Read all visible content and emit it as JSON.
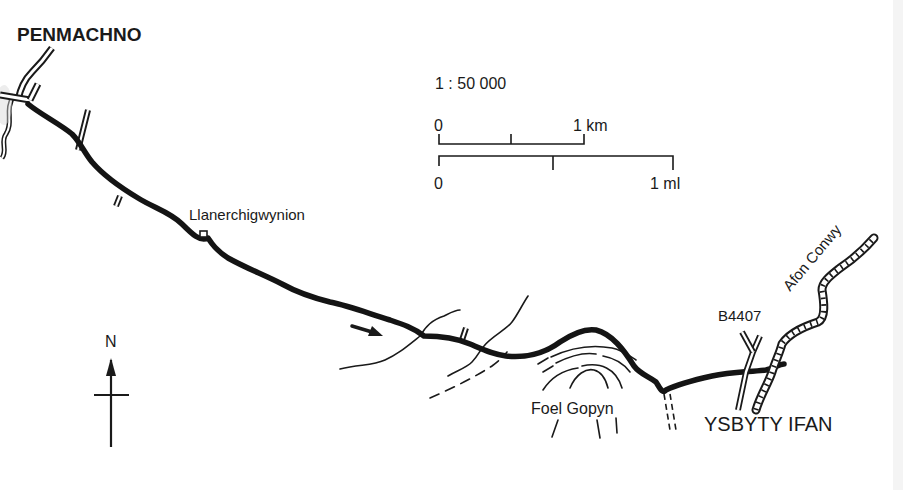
{
  "map": {
    "title": "",
    "places": {
      "start": "PENMACHNO",
      "farm": "Llanerchigwynion",
      "hill": "Foel Gopyn",
      "end": "YSBYTY IFAN"
    },
    "road_label": "B4407",
    "river_label": "Afon Conwy",
    "scale": {
      "ratio": "1 : 50 000",
      "km_start": "0",
      "km_end": "1 km",
      "ml_start": "0",
      "ml_end": "1 ml"
    },
    "north_label": "N",
    "icons": {
      "north_arrow": "north-arrow-icon",
      "direction_arrow": "direction-arrow-icon",
      "building": "building-square-icon"
    },
    "colors": {
      "ink": "#1a1a1a",
      "paper": "#ffffff"
    }
  }
}
